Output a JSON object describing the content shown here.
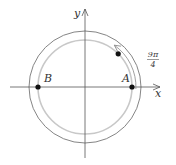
{
  "diagram": {
    "type": "unit-circle-rotation",
    "center": {
      "x": 85,
      "y": 87
    },
    "axes": {
      "x_label": "x",
      "y_label": "y",
      "color": "#555555"
    },
    "circles": {
      "inner": {
        "radius": 47,
        "color": "#c8c8c8"
      },
      "outer": {
        "radius": 56,
        "color": "#777777"
      }
    },
    "points": [
      {
        "label": "A",
        "angle_deg": 0
      },
      {
        "label": "B",
        "angle_deg": 180
      },
      {
        "label": "",
        "angle_deg": 45
      }
    ],
    "rotation_arrow": {
      "label_numerator": "9π",
      "label_denominator": "4",
      "direction": "counterclockwise",
      "color": "#888888"
    },
    "point_color": "#111111"
  }
}
